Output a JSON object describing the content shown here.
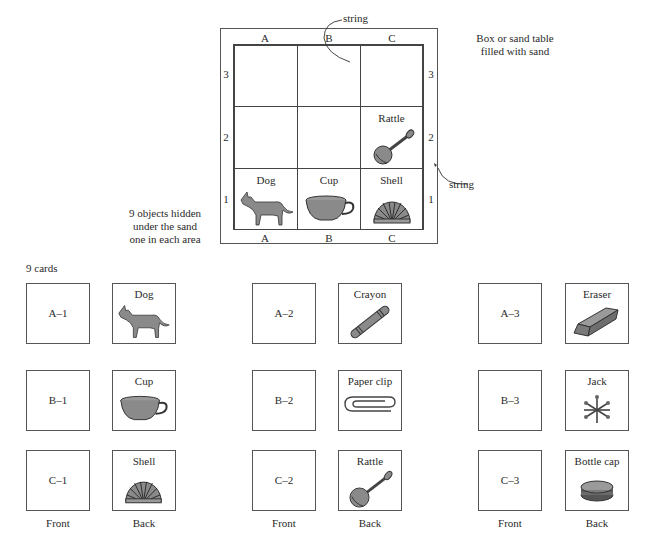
{
  "sandbox": {
    "column_labels": [
      "A",
      "B",
      "C"
    ],
    "row_labels": [
      "3",
      "2",
      "1"
    ],
    "string_label_top": "string",
    "string_label_right": "string",
    "box_note_line1": "Box or sand table",
    "box_note_line2": "filled with sand",
    "hidden_note_line1": "9 objects hidden",
    "hidden_note_line2": "under the sand",
    "hidden_note_line3": "one in each area",
    "visible_objects": [
      {
        "cell": "C2",
        "label": "Rattle",
        "icon": "rattle-icon"
      },
      {
        "cell": "A1",
        "label": "Dog",
        "icon": "dog-icon"
      },
      {
        "cell": "B1",
        "label": "Cup",
        "icon": "cup-icon"
      },
      {
        "cell": "C1",
        "label": "Shell",
        "icon": "shell-icon"
      }
    ]
  },
  "cards": {
    "title": "9 cards",
    "front_label": "Front",
    "back_label": "Back",
    "items": [
      {
        "code": "A–1",
        "name": "Dog",
        "icon": "dog-icon"
      },
      {
        "code": "A–2",
        "name": "Crayon",
        "icon": "crayon-icon"
      },
      {
        "code": "A–3",
        "name": "Eraser",
        "icon": "eraser-icon"
      },
      {
        "code": "B–1",
        "name": "Cup",
        "icon": "cup-icon"
      },
      {
        "code": "B–2",
        "name": "Paper clip",
        "icon": "paper-clip-icon"
      },
      {
        "code": "B–3",
        "name": "Jack",
        "icon": "jack-icon"
      },
      {
        "code": "C–1",
        "name": "Shell",
        "icon": "shell-icon"
      },
      {
        "code": "C–2",
        "name": "Rattle",
        "icon": "rattle-icon"
      },
      {
        "code": "C–3",
        "name": "Bottle cap",
        "icon": "bottle-cap-icon"
      }
    ]
  },
  "colors": {
    "ink": "#2a2a2a",
    "fill_gray": "#8a8a8a"
  }
}
